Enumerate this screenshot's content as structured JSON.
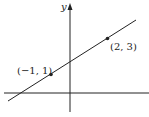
{
  "diagram": {
    "axis_label_y": "y",
    "points": [
      {
        "label": "(−1, 1)",
        "x": -1,
        "y": 1
      },
      {
        "label": "(2, 3)",
        "x": 2,
        "y": 3
      }
    ],
    "line_description": "Straight line passing through (-1, 1) and (2, 3)"
  }
}
